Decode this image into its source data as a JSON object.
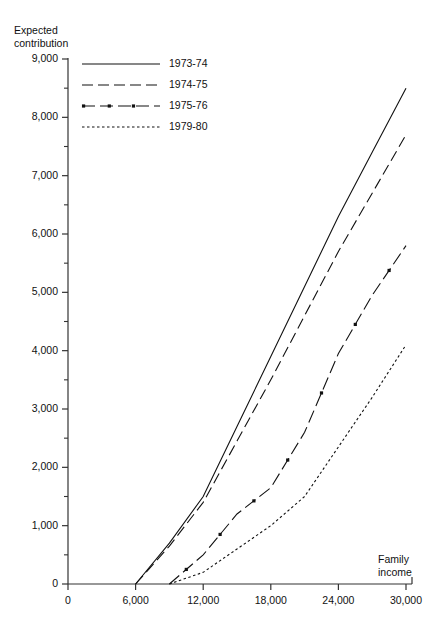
{
  "chart_data": {
    "type": "line",
    "title": "",
    "ylabel": "Expected\ncontribution",
    "xlabel": "Family\nincome",
    "xlim": [
      0,
      30000
    ],
    "ylim": [
      0,
      9000
    ],
    "grid": false,
    "legend_position": "top-left-inside",
    "x_ticks": [
      "0",
      "6,000",
      "12,000",
      "18,000",
      "24,000",
      "30,000"
    ],
    "x_tick_values": [
      0,
      6000,
      12000,
      18000,
      24000,
      30000
    ],
    "y_ticks": [
      "0",
      "1,000",
      "2,000",
      "3,000",
      "4,000",
      "5,000",
      "6,000",
      "7,000",
      "8,000",
      "9,000"
    ],
    "y_tick_values": [
      0,
      1000,
      2000,
      3000,
      4000,
      5000,
      6000,
      7000,
      8000,
      9000
    ],
    "y_minor_tick_values": [
      500,
      1500,
      2500,
      3500,
      4500,
      5500,
      6500,
      7500,
      8500
    ],
    "series": [
      {
        "name": "1973-74",
        "style": "solid",
        "x": [
          6000,
          9000,
          12000,
          15000,
          18000,
          21000,
          24000,
          27000,
          30000
        ],
        "values": [
          0,
          700,
          1500,
          2700,
          3900,
          5100,
          6300,
          7400,
          8500
        ]
      },
      {
        "name": "1974-75",
        "style": "dashed",
        "x": [
          6000,
          9000,
          12000,
          15000,
          18000,
          21000,
          24000,
          27000,
          30000
        ],
        "values": [
          0,
          650,
          1400,
          2450,
          3500,
          4600,
          5700,
          6700,
          7700
        ]
      },
      {
        "name": "1975-76",
        "style": "dash-dot",
        "x": [
          9000,
          12000,
          15000,
          18000,
          21000,
          24000,
          27000,
          30000
        ],
        "values": [
          0,
          500,
          1200,
          1650,
          2600,
          3950,
          4950,
          5800
        ]
      },
      {
        "name": "1979-80",
        "style": "dotted",
        "x": [
          9000,
          12000,
          15000,
          18000,
          21000,
          24000,
          27000,
          30000
        ],
        "values": [
          0,
          200,
          600,
          1000,
          1500,
          2350,
          3200,
          4100
        ]
      }
    ]
  },
  "legend": {
    "items": [
      {
        "label": "1973-74",
        "style": "solid"
      },
      {
        "label": "1974-75",
        "style": "dashed"
      },
      {
        "label": "1975-76",
        "style": "dash-dot"
      },
      {
        "label": "1979-80",
        "style": "dotted"
      }
    ]
  },
  "colors": {
    "line": "#111111",
    "axis": "#333333",
    "background": "#ffffff"
  }
}
